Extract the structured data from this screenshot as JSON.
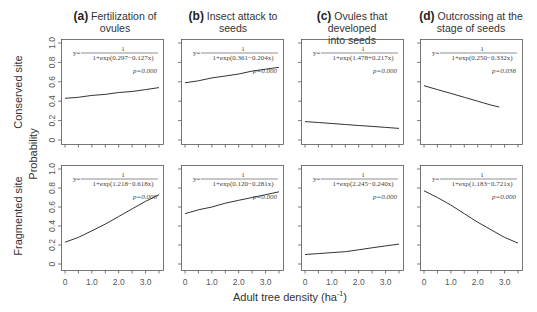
{
  "chart_data": {
    "type": "line",
    "layout": "2x4 grid of panels",
    "xlabel": "Adult tree density (ha⁻¹)",
    "ylabel": "Probability",
    "xlim": [
      0,
      3.5
    ],
    "ylim": [
      0,
      1
    ],
    "xticks": [
      0,
      0.5,
      1.0,
      1.5,
      2.0,
      2.5,
      3.0,
      3.5
    ],
    "xtick_labels": [
      "0",
      "1.0",
      "2.0",
      "3.0"
    ],
    "ytick_labels": [
      "0",
      "0.2",
      "0.4",
      "0.6",
      "0.8",
      "1.0"
    ],
    "grid": false,
    "columns": [
      {
        "letter": "(a)",
        "title": "Fertilization of ovules"
      },
      {
        "letter": "(b)",
        "title": "Insect attack to seeds"
      },
      {
        "letter": "(c)",
        "title": "Ovules that developed into seeds"
      },
      {
        "letter": "(d)",
        "title": "Outcrossing at the stage of seeds"
      }
    ],
    "rows": [
      {
        "label": "Conserved site"
      },
      {
        "label": "Fragmented site"
      }
    ],
    "panels": [
      {
        "row": 0,
        "col": 0,
        "equation_num": "1",
        "equation_den": "1+exp(0.297−0.127x)",
        "p": "p=0.000",
        "x": [
          0,
          0.5,
          1.0,
          1.5,
          2.0,
          2.5,
          3.0,
          3.5
        ],
        "y": [
          0.43,
          0.44,
          0.46,
          0.47,
          0.49,
          0.5,
          0.52,
          0.54
        ]
      },
      {
        "row": 0,
        "col": 1,
        "equation_num": "1",
        "equation_den": "1+exp(0.361−0.204x)",
        "p": "p=0.000",
        "x": [
          0,
          0.5,
          1.0,
          1.5,
          2.0,
          2.5,
          3.0,
          3.5
        ],
        "y": [
          0.59,
          0.61,
          0.64,
          0.66,
          0.68,
          0.71,
          0.73,
          0.75
        ]
      },
      {
        "row": 0,
        "col": 2,
        "equation_num": "1",
        "equation_den": "1+exp(1.478+0.217x)",
        "p": "p=0.000",
        "x": [
          0,
          0.5,
          1.0,
          1.5,
          2.0,
          2.5,
          3.0,
          3.5
        ],
        "y": [
          0.19,
          0.18,
          0.17,
          0.16,
          0.15,
          0.14,
          0.13,
          0.12
        ]
      },
      {
        "row": 0,
        "col": 3,
        "equation_num": "1",
        "equation_den": "1+exp(0.250−0.332x)",
        "p": "p=0.038",
        "x": [
          0,
          0.5,
          1.0,
          1.5,
          2.0,
          2.5,
          2.8
        ],
        "y": [
          0.56,
          0.52,
          0.48,
          0.44,
          0.4,
          0.36,
          0.34
        ]
      },
      {
        "row": 1,
        "col": 0,
        "equation_num": "1",
        "equation_den": "1+exp(1.218−0.618x)",
        "p": "p=0.000",
        "x": [
          0,
          0.5,
          1.0,
          1.5,
          2.0,
          2.5,
          3.0,
          3.5
        ],
        "y": [
          0.23,
          0.28,
          0.35,
          0.42,
          0.5,
          0.58,
          0.66,
          0.73
        ]
      },
      {
        "row": 1,
        "col": 1,
        "equation_num": "1",
        "equation_den": "1+exp(0.120−0.281x)",
        "p": "p=0.000",
        "x": [
          0,
          0.5,
          1.0,
          1.5,
          2.0,
          2.5,
          3.0,
          3.5
        ],
        "y": [
          0.53,
          0.57,
          0.6,
          0.64,
          0.67,
          0.7,
          0.73,
          0.76
        ]
      },
      {
        "row": 1,
        "col": 2,
        "equation_num": "1",
        "equation_den": "1+exp(2.245−0.240x)",
        "p": "p=0.000",
        "x": [
          0,
          0.5,
          1.0,
          1.5,
          2.0,
          2.5,
          3.0,
          3.5
        ],
        "y": [
          0.1,
          0.11,
          0.12,
          0.13,
          0.15,
          0.17,
          0.19,
          0.21
        ]
      },
      {
        "row": 1,
        "col": 3,
        "equation_num": "1",
        "equation_den": "1+exp(1.183−0.721x)",
        "p": "p=0.000",
        "x": [
          0,
          0.5,
          1.0,
          1.5,
          2.0,
          2.5,
          3.0,
          3.5
        ],
        "y": [
          0.77,
          0.7,
          0.62,
          0.53,
          0.44,
          0.36,
          0.28,
          0.22
        ]
      }
    ]
  },
  "labels": {
    "col_a_letter": "(a)",
    "col_a_title": "Fertilization of ovules",
    "col_b_letter": "(b)",
    "col_b_title": "Insect attack to seeds",
    "col_c_letter": "(c)",
    "col_c_title_1": "Ovules that developed",
    "col_c_title_2": "into seeds",
    "col_d_letter": "(d)",
    "col_d_title_1": "Outcrossing at the",
    "col_d_title_2": "stage of seeds",
    "row_top": "Conserved site",
    "row_bottom": "Fragmented site",
    "ylabel": "Probability",
    "xlabel_main": "Adult tree density (ha",
    "xlabel_sup": "-1",
    "xlabel_end": ")"
  }
}
